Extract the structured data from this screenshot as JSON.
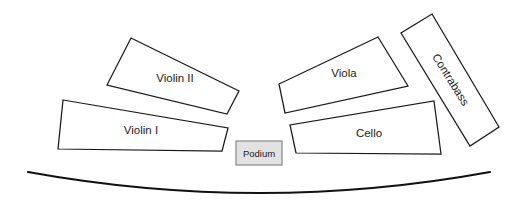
{
  "diagram": {
    "type": "seating-plan",
    "canvas": {
      "width": 521,
      "height": 208
    },
    "background_color": "#ffffff",
    "outline_color": "#1a1a1a",
    "section_fill": "#ffffff",
    "podium_fill": "#e2e2e2",
    "podium_stroke": "#8c8c8c",
    "arc_color": "#111111"
  },
  "sections": [
    {
      "id": "violin-1",
      "label": "Violin I",
      "points": "63,100 228,128 222,151 58,149",
      "label_x": 141,
      "label_y": 131,
      "rotation": 0
    },
    {
      "id": "violin-2",
      "label": "Violin II",
      "points": "131,38 239,91 227,114 107,85",
      "label_x": 175,
      "label_y": 79,
      "rotation": 0
    },
    {
      "id": "viola",
      "label": "Viola",
      "points": "378,37 408,86 285,113 279,84",
      "label_x": 344,
      "label_y": 74,
      "rotation": 0
    },
    {
      "id": "cello",
      "label": "Cello",
      "points": "434,101 441,154 296,153 290,125",
      "label_x": 369,
      "label_y": 134,
      "rotation": 0
    },
    {
      "id": "contrabass",
      "label": "Contrabass",
      "points": "432,14 499,127 470,146 401,33",
      "label_x": 450,
      "label_y": 80,
      "rotation": 58
    }
  ],
  "podium": {
    "id": "podium",
    "label": "Podium",
    "x": 236,
    "y": 141,
    "width": 46,
    "height": 24,
    "label_x": 259,
    "label_y": 154
  },
  "stage_front": {
    "id": "stage-front-arc",
    "path": "M 28 172 Q 260 214 490 172"
  }
}
